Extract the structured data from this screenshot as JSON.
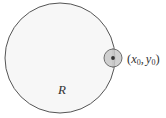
{
  "figure": {
    "background_color": "#ffffff",
    "width": 166,
    "height": 118
  },
  "big_circle": {
    "name": "region-disk",
    "cx": 60,
    "cy": 58,
    "r": 55,
    "fill_color": "#f7f7f7",
    "stroke_color": "#555555",
    "stroke_width": 1
  },
  "small_circle": {
    "name": "boundary-point-marker",
    "cx": 113,
    "cy": 58,
    "r": 9,
    "fill_color": "#c9c9c9",
    "stroke_color": "#6e6e6e",
    "stroke_width": 1,
    "center_dot_r": 1.9,
    "center_dot_color": "#333333",
    "tick_color": "#777777"
  },
  "labels": {
    "radius": {
      "text": "R",
      "x": 58,
      "y": 94,
      "color": "#333333"
    },
    "point": {
      "open_paren": "(",
      "x_var": "x",
      "x_sub": "0",
      "comma": ",",
      "y_var": "y",
      "y_sub": "0",
      "close_paren": ")",
      "full_text": "(x0, y0)",
      "x": 127,
      "y": 63,
      "color": "#333333"
    }
  }
}
